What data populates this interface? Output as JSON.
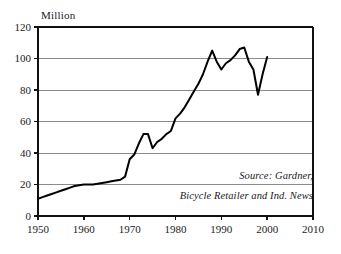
{
  "chart_data": {
    "type": "line",
    "title": "",
    "subtitle": "",
    "unit_label": "Million",
    "xlabel": "",
    "ylabel": "",
    "xlim": [
      1950,
      2010
    ],
    "ylim": [
      0,
      120
    ],
    "xticks": [
      "1950",
      "1960",
      "1970",
      "1980",
      "1990",
      "2000",
      "2010"
    ],
    "xtick_values": [
      1950,
      1960,
      1970,
      1980,
      1990,
      2000,
      2010
    ],
    "yticks": [
      "0",
      "20",
      "40",
      "60",
      "80",
      "100",
      "120"
    ],
    "ytick_values": [
      0,
      20,
      40,
      60,
      80,
      100,
      120
    ],
    "grid": "horizontal",
    "legend": "none",
    "line_color": "#000000",
    "grid_color": "#8a8a8a",
    "axis_color": "#111111",
    "background": "#ffffff",
    "series": [
      {
        "name": "World Bicycle Production",
        "x": [
          1950,
          1951,
          1952,
          1953,
          1954,
          1955,
          1956,
          1957,
          1958,
          1959,
          1960,
          1961,
          1962,
          1963,
          1964,
          1965,
          1966,
          1967,
          1968,
          1969,
          1970,
          1971,
          1972,
          1973,
          1974,
          1975,
          1976,
          1977,
          1978,
          1979,
          1980,
          1981,
          1982,
          1983,
          1984,
          1985,
          1986,
          1987,
          1988,
          1989,
          1990,
          1991,
          1992,
          1993,
          1994,
          1995,
          1996,
          1997,
          1998,
          1999,
          2000
        ],
        "values": [
          11,
          12,
          13,
          14,
          15,
          16,
          17,
          18,
          19,
          19.5,
          20,
          20,
          20,
          20.5,
          21,
          21.5,
          22,
          22.5,
          23,
          25,
          36,
          39,
          46,
          52,
          52,
          43,
          47,
          49,
          52,
          54,
          62,
          65,
          69,
          74,
          79,
          84,
          90,
          98,
          105,
          98,
          93,
          97,
          99,
          102,
          106,
          107,
          98,
          93,
          77,
          90,
          101
        ]
      }
    ],
    "annotations": [
      {
        "name": "source-line-1",
        "text": "Source: Gardner,"
      },
      {
        "name": "source-line-2",
        "text": "Bicycle Retailer and Ind. News"
      }
    ]
  },
  "axes": {
    "unit_label": "Million",
    "y_labels": [
      "120",
      "100",
      "80",
      "60",
      "40",
      "20",
      "0"
    ],
    "x_labels": [
      "1950",
      "1960",
      "1970",
      "1980",
      "1990",
      "2000",
      "2010"
    ]
  },
  "source": {
    "line1": "Source: Gardner,",
    "line2": "Bicycle Retailer and Ind. News"
  }
}
